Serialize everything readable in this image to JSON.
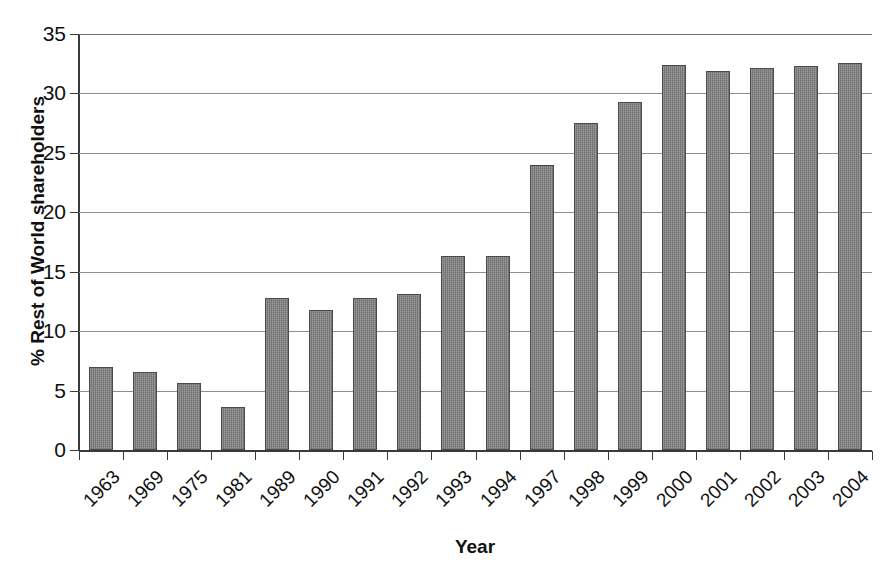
{
  "chart_data": {
    "type": "bar",
    "title": "",
    "xlabel": "Year",
    "ylabel": "% Rest of World shareholders",
    "categories": [
      "1963",
      "1969",
      "1975",
      "1981",
      "1989",
      "1990",
      "1991",
      "1992",
      "1993",
      "1994",
      "1997",
      "1998",
      "1999",
      "2000",
      "2001",
      "2002",
      "2003",
      "2004"
    ],
    "values": [
      7.0,
      6.6,
      5.6,
      3.6,
      12.8,
      11.8,
      12.8,
      13.1,
      16.3,
      16.3,
      24.0,
      27.5,
      29.3,
      32.4,
      31.9,
      32.1,
      32.3,
      32.6
    ],
    "ylim": [
      0,
      35
    ],
    "yticks": [
      0,
      5,
      10,
      15,
      20,
      25,
      30,
      35
    ],
    "ytick_labels": [
      "0",
      "5",
      "10",
      "15",
      "20",
      "25",
      "30",
      "35"
    ],
    "grid": true,
    "grid_axis": "y",
    "legend": null,
    "bar_color": "#7b7b7b",
    "bar_edge_color": "#4a4a4a",
    "gridline_color": "#8e8e8e",
    "axis_color": "#3a3a3a",
    "background": "#ffffff"
  }
}
